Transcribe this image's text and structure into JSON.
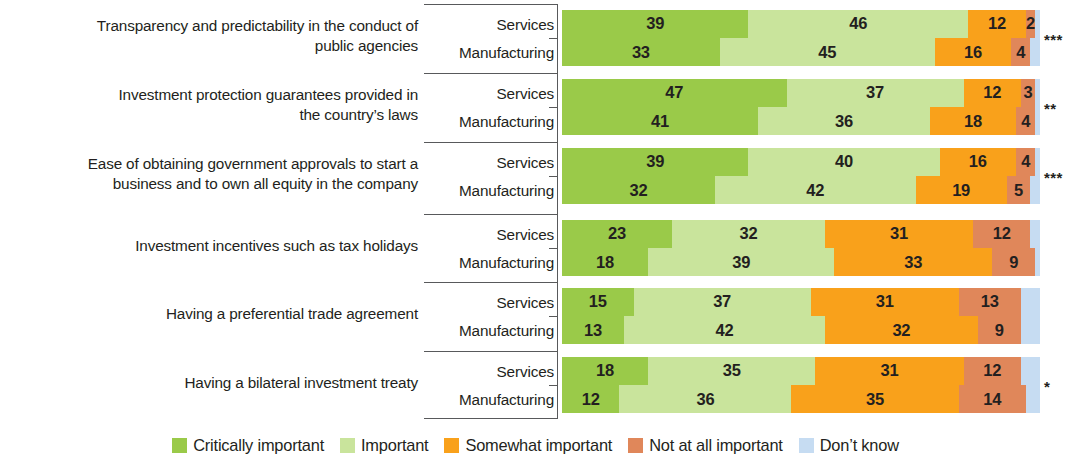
{
  "chart_data": {
    "type": "bar",
    "subtype": "stacked-horizontal-100",
    "title": "",
    "xlabel": "",
    "ylabel": "",
    "xlim": [
      0,
      100
    ],
    "grid": false,
    "legend_position": "bottom",
    "series": [
      {
        "name": "Critically important",
        "color": "#9ACA49"
      },
      {
        "name": "Important",
        "color": "#C9E49C"
      },
      {
        "name": "Somewhat important",
        "color": "#F9A11B"
      },
      {
        "name": "Not at all important",
        "color": "#E0875A"
      },
      {
        "name": "Don't know",
        "color": "#C6DCF2"
      }
    ],
    "group_series": [
      "Services",
      "Manufacturing"
    ],
    "categories": [
      "Transparency and predictability in the conduct of public agencies",
      "Investment protection guarantees provided in the country’s laws",
      "Ease of obtaining government approvals to start a business and to own all equity in the company",
      "Investment incentives such as tax holidays",
      "Having a preferential trade agreement",
      "Having a bilateral investment treaty"
    ],
    "groups": [
      {
        "label_lines": [
          "Transparency and predictability in the conduct of",
          "public agencies"
        ],
        "significance": "***",
        "rows": [
          {
            "name": "Services",
            "values": [
              39,
              46,
              12,
              2,
              1
            ],
            "labels": [
              "39",
              "46",
              "12",
              "2",
              ""
            ]
          },
          {
            "name": "Manufacturing",
            "values": [
              33,
              45,
              16,
              4,
              2
            ],
            "labels": [
              "33",
              "45",
              "16",
              "4",
              ""
            ]
          }
        ]
      },
      {
        "label_lines": [
          "Investment protection guarantees provided in",
          "the country’s laws"
        ],
        "significance": "**",
        "rows": [
          {
            "name": "Services",
            "values": [
              47,
              37,
              12,
              3,
              1
            ],
            "labels": [
              "47",
              "37",
              "12",
              "3",
              ""
            ]
          },
          {
            "name": "Manufacturing",
            "values": [
              41,
              36,
              18,
              4,
              1
            ],
            "labels": [
              "41",
              "36",
              "18",
              "4",
              ""
            ]
          }
        ]
      },
      {
        "label_lines": [
          "Ease of obtaining government approvals to start a",
          "business and to own all equity in the company"
        ],
        "significance": "***",
        "rows": [
          {
            "name": "Services",
            "values": [
              39,
              40,
              16,
              4,
              1
            ],
            "labels": [
              "39",
              "40",
              "16",
              "4",
              ""
            ]
          },
          {
            "name": "Manufacturing",
            "values": [
              32,
              42,
              19,
              5,
              2
            ],
            "labels": [
              "32",
              "42",
              "19",
              "5",
              ""
            ]
          }
        ]
      },
      {
        "label_lines": [
          "Investment incentives such as tax holidays"
        ],
        "significance": "",
        "rows": [
          {
            "name": "Services",
            "values": [
              23,
              32,
              31,
              12,
              2
            ],
            "labels": [
              "23",
              "32",
              "31",
              "12",
              ""
            ]
          },
          {
            "name": "Manufacturing",
            "values": [
              18,
              39,
              33,
              9,
              1
            ],
            "labels": [
              "18",
              "39",
              "33",
              "9",
              ""
            ]
          }
        ]
      },
      {
        "label_lines": [
          "Having a preferential trade agreement"
        ],
        "significance": "",
        "rows": [
          {
            "name": "Services",
            "values": [
              15,
              37,
              31,
              13,
              4
            ],
            "labels": [
              "15",
              "37",
              "31",
              "13",
              ""
            ]
          },
          {
            "name": "Manufacturing",
            "values": [
              13,
              42,
              32,
              9,
              4
            ],
            "labels": [
              "13",
              "42",
              "32",
              "9",
              ""
            ]
          }
        ]
      },
      {
        "label_lines": [
          "Having a bilateral investment treaty"
        ],
        "significance": "*",
        "rows": [
          {
            "name": "Services",
            "values": [
              18,
              35,
              31,
              12,
              4
            ],
            "labels": [
              "18",
              "35",
              "31",
              "12",
              ""
            ]
          },
          {
            "name": "Manufacturing",
            "values": [
              12,
              36,
              35,
              14,
              3
            ],
            "labels": [
              "12",
              "36",
              "35",
              "14",
              ""
            ]
          }
        ]
      }
    ]
  },
  "legend": {
    "items": [
      {
        "label": "Critically important",
        "color": "#9ACA49"
      },
      {
        "label": "Important",
        "color": "#C9E49C"
      },
      {
        "label": "Somewhat important",
        "color": "#F9A11B"
      },
      {
        "label": "Not at all important",
        "color": "#E0875A"
      },
      {
        "label": "Don’t know",
        "color": "#C6DCF2"
      }
    ]
  }
}
